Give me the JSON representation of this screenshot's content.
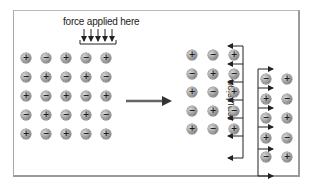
{
  "diagram": {
    "force_label": "force applied here",
    "repulsion_label": "repulsion",
    "colors": {
      "ion_fill": "#9a9a9a",
      "arrow": "#333333",
      "frame": "#9a9a9a"
    },
    "icons": {
      "positive_ion": "plus-ion-icon",
      "negative_ion": "minus-ion-icon",
      "transition_arrow": "right-arrow-icon"
    },
    "left_lattice": {
      "rows": [
        [
          "+",
          "-",
          "+",
          "-",
          "+"
        ],
        [
          "-",
          "+",
          "-",
          "+",
          "-"
        ],
        [
          "+",
          "-",
          "+",
          "-",
          "+"
        ],
        [
          "-",
          "+",
          "-",
          "+",
          "-"
        ],
        [
          "+",
          "-",
          "+",
          "-",
          "+"
        ]
      ]
    },
    "right_lattice_left_block": {
      "rows": [
        [
          "+",
          "-",
          "+"
        ],
        [
          "-",
          "+",
          "-"
        ],
        [
          "+",
          "-",
          "+"
        ],
        [
          "-",
          "+",
          "-"
        ],
        [
          "+",
          "-",
          "+"
        ]
      ]
    },
    "right_lattice_right_block": {
      "rows": [
        [
          "-",
          "+"
        ],
        [
          "+",
          "-"
        ],
        [
          "-",
          "+"
        ],
        [
          "+",
          "-"
        ],
        [
          "-",
          "+"
        ]
      ]
    }
  }
}
